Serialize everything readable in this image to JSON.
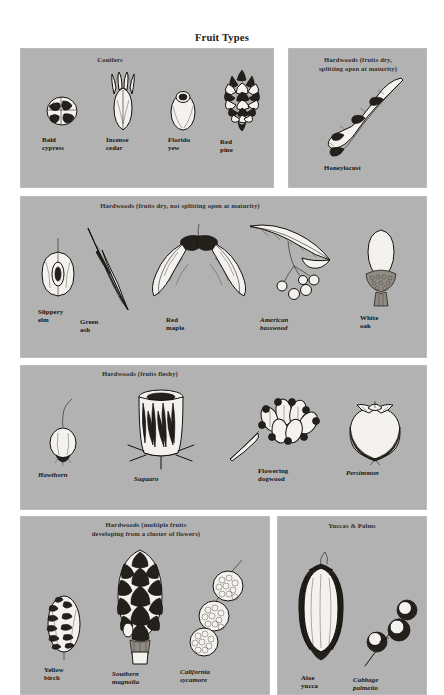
{
  "title": "Fruit Types",
  "colors": {
    "page_background": "#ffffff",
    "panel_background": "#b2b2b2",
    "ink": "#15110d",
    "title_text": "#1b1b1b",
    "panel_title_text": "#2e2e2e"
  },
  "panels": [
    {
      "id": "conifers",
      "title": "Conifers",
      "specimens": [
        {
          "id": "bald-cypress",
          "label": "Bald\ncypress",
          "style": "roman"
        },
        {
          "id": "incense-cedar",
          "label": "Incense\ncedar",
          "style": "roman"
        },
        {
          "id": "florida-yew",
          "label": "Florido\nyew",
          "style": "roman"
        },
        {
          "id": "red-pine",
          "label": "Red\npine",
          "style": "roman"
        }
      ]
    },
    {
      "id": "hardwoods-dry-splitting",
      "title": "Hardwoods (fruits dry,\nsplitting open at maturity)",
      "specimens": [
        {
          "id": "honeylocust",
          "label": "Honeylocust",
          "style": "roman"
        }
      ]
    },
    {
      "id": "hardwoods-dry-not-splitting",
      "title": "Hardwoods (fruits dry, not splitting open at maturity)",
      "specimens": [
        {
          "id": "slippery-elm",
          "label": "Slippery\nelm",
          "style": "roman"
        },
        {
          "id": "green-ash",
          "label": "Green\nash",
          "style": "roman"
        },
        {
          "id": "red-maple",
          "label": "Red\nmaple",
          "style": "roman"
        },
        {
          "id": "american-basswood",
          "label": "American\nbasswood",
          "style": "italic"
        },
        {
          "id": "white-oak",
          "label": "White\noak",
          "style": "roman"
        }
      ]
    },
    {
      "id": "hardwoods-fleshy",
      "title": "Hardwoods (fruits fleshy)",
      "specimens": [
        {
          "id": "hawthorn",
          "label": "Hawthorn",
          "style": "italic"
        },
        {
          "id": "saguaro",
          "label": "Saguaro",
          "style": "italic"
        },
        {
          "id": "flowering-dogwood",
          "label": "Flowering\ndogwood",
          "style": "roman"
        },
        {
          "id": "persimmon",
          "label": "Persimmon",
          "style": "italic"
        }
      ]
    },
    {
      "id": "hardwoods-multiple",
      "title": "Hardwoods (multiple fruits\ndeveloping from a cluster of flowers)",
      "specimens": [
        {
          "id": "yellow-birch",
          "label": "Yellow\nbirch",
          "style": "roman"
        },
        {
          "id": "southern-magnolia",
          "label": "Southern\nmagnolia",
          "style": "italic"
        },
        {
          "id": "california-sycamore",
          "label": "California\nsycamore",
          "style": "italic"
        }
      ]
    },
    {
      "id": "yuccas-palms",
      "title": "Yuccas & Palms",
      "specimens": [
        {
          "id": "aloe-yucca",
          "label": "Aloe\nyucca",
          "style": "roman"
        },
        {
          "id": "cabbage-palmetto",
          "label": "Cabbage\npalmetto",
          "style": "italic"
        }
      ]
    }
  ]
}
